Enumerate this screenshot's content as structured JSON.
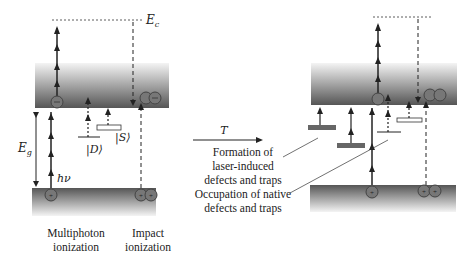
{
  "labels": {
    "ec": "E",
    "ec_sub": "c",
    "eg": "E",
    "eg_sub": "g",
    "hv": "hν",
    "d_state": "|D⟩",
    "s_state": "|S⟩",
    "t_arrow": "T"
  },
  "captions": {
    "multiphoton_line1": "Multiphoton",
    "multiphoton_line2": "ionization",
    "impact_line1": "Impact",
    "impact_line2": "ionization",
    "formation_line1": "Formation of",
    "formation_line2": "laser-induced",
    "formation_line3": "defects and traps",
    "occupation_line1": "Occupation of native",
    "occupation_line2": "defects and traps"
  },
  "colors": {
    "band_dark": "#555555",
    "band_light": "#f2f2f2",
    "arrow": "#222222",
    "trap_fill": "#666666"
  }
}
